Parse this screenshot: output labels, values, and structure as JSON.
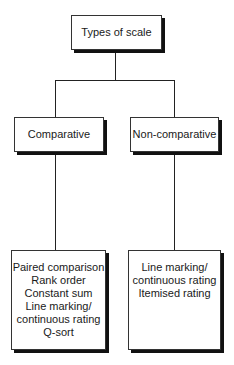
{
  "root": {
    "label": "Types of scale"
  },
  "branches": [
    {
      "label": "Comparative",
      "items": [
        "Paired comparison",
        "Rank order",
        "Constant sum",
        "Line marking/",
        "continuous rating",
        "Q-sort"
      ]
    },
    {
      "label": "Non-comparative",
      "items": [
        "Line marking/",
        "continuous rating",
        "Itemised rating"
      ]
    }
  ]
}
